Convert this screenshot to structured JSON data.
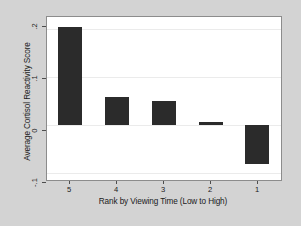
{
  "chart_data": {
    "type": "bar",
    "title": "",
    "subtitle": "",
    "xlabel": "Rank by Viewing Time (Low to High)",
    "ylabel": "Average Cortisol Reactivity Score",
    "categories": [
      "5",
      "4",
      "3",
      "2",
      "1"
    ],
    "values": [
      0.204,
      0.058,
      0.05,
      0.006,
      -0.081
    ],
    "series": [
      {
        "name": "Average Cortisol Reactivity Score",
        "values": [
          0.204,
          0.058,
          0.05,
          0.006,
          -0.081
        ]
      }
    ],
    "ylim": [
      -0.115,
      0.225
    ],
    "yticks": [
      0.2,
      0.1,
      0.0,
      -0.1
    ],
    "ytick_labels": [
      ".2",
      ".1",
      "0",
      "-.1"
    ],
    "xtick_labels": [
      "5",
      "4",
      "3",
      "2",
      "1"
    ],
    "grid": true,
    "legend": false,
    "legend_position": "none",
    "bar_color": "#2b2b2b",
    "plot_background": "#ffffff",
    "figure_background": "#d3d3d3",
    "axis_color": "#8c8c8c"
  },
  "axes": {
    "y_title": "Average Cortisol Reactivity Score",
    "x_title": "Rank by Viewing Time (Low to High)",
    "y_tick_0": ".2",
    "y_tick_1": ".1",
    "y_tick_2": "0",
    "y_tick_3": "-.1",
    "x_tick_0": "5",
    "x_tick_1": "4",
    "x_tick_2": "3",
    "x_tick_3": "2",
    "x_tick_4": "1"
  }
}
